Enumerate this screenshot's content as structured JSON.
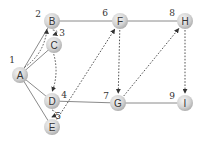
{
  "colors": {
    "node_fill_light": "#f2f2f2",
    "node_fill_dark": "#b8b8b8",
    "edge": "#8a8a8a",
    "arrow": "#555555",
    "text": "#333333"
  },
  "nodes": [
    {
      "id": "A",
      "label": "A",
      "x": 20,
      "y": 75
    },
    {
      "id": "B",
      "label": "B",
      "x": 52,
      "y": 21
    },
    {
      "id": "C",
      "label": "C",
      "x": 54,
      "y": 45
    },
    {
      "id": "D",
      "label": "D",
      "x": 52,
      "y": 101
    },
    {
      "id": "E",
      "label": "E",
      "x": 52,
      "y": 127
    },
    {
      "id": "F",
      "label": "F",
      "x": 120,
      "y": 21
    },
    {
      "id": "G",
      "label": "G",
      "x": 118,
      "y": 103
    },
    {
      "id": "H",
      "label": "H",
      "x": 185,
      "y": 21
    },
    {
      "id": "I",
      "label": "I",
      "x": 185,
      "y": 103
    }
  ],
  "edges": [
    [
      "A",
      "B"
    ],
    [
      "A",
      "C"
    ],
    [
      "A",
      "D"
    ],
    [
      "A",
      "E"
    ],
    [
      "B",
      "F"
    ],
    [
      "F",
      "H"
    ],
    [
      "D",
      "G"
    ],
    [
      "G",
      "I"
    ]
  ],
  "traversal_arrows": [
    {
      "from": "A",
      "to": "B"
    },
    {
      "from": "B",
      "to": "C"
    },
    {
      "from": "C",
      "to": "D"
    },
    {
      "from": "D",
      "to": "E"
    },
    {
      "from": "E",
      "to": "F"
    },
    {
      "from": "F",
      "to": "G"
    },
    {
      "from": "G",
      "to": "H"
    },
    {
      "from": "H",
      "to": "I"
    }
  ],
  "step_labels": [
    {
      "text": "1",
      "x": 12,
      "y": 60
    },
    {
      "text": "2",
      "x": 38,
      "y": 14
    },
    {
      "text": "3",
      "x": 62,
      "y": 33
    },
    {
      "text": "4",
      "x": 64,
      "y": 95
    },
    {
      "text": "5",
      "x": 58,
      "y": 116
    },
    {
      "text": "6",
      "x": 105,
      "y": 13
    },
    {
      "text": "7",
      "x": 106,
      "y": 96
    },
    {
      "text": "8",
      "x": 172,
      "y": 13
    },
    {
      "text": "9",
      "x": 172,
      "y": 96
    }
  ]
}
